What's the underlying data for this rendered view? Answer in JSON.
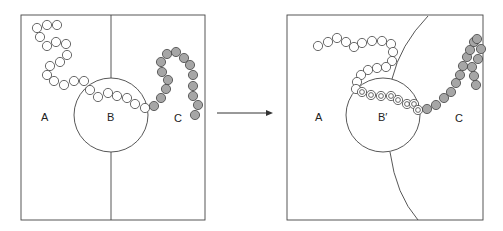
{
  "colors": {
    "stroke": "#333333",
    "bead_white": "#ffffff",
    "bead_gray": "#a6a6a6",
    "background": "#ffffff"
  },
  "left_panel": {
    "labels": {
      "region_a": "A",
      "region_b": "B",
      "region_c": "C"
    },
    "white_beads": [
      [
        37,
        28
      ],
      [
        47,
        25
      ],
      [
        57,
        25
      ],
      [
        40,
        37
      ],
      [
        47,
        46
      ],
      [
        56,
        42
      ],
      [
        66,
        44
      ],
      [
        67,
        55
      ],
      [
        60,
        62
      ],
      [
        50,
        66
      ],
      [
        47,
        75
      ],
      [
        54,
        81
      ],
      [
        64,
        85
      ],
      [
        74,
        81
      ],
      [
        84,
        81
      ],
      [
        90,
        90
      ],
      [
        98,
        97
      ],
      [
        108,
        93
      ],
      [
        117,
        96
      ],
      [
        127,
        98
      ],
      [
        135,
        104
      ],
      [
        145,
        108
      ]
    ],
    "gray_beads": [
      [
        154,
        106
      ],
      [
        161,
        98
      ],
      [
        166,
        89
      ],
      [
        168,
        80
      ],
      [
        162,
        72
      ],
      [
        161,
        62
      ],
      [
        167,
        54
      ],
      [
        176,
        52
      ],
      [
        184,
        58
      ],
      [
        190,
        65
      ],
      [
        193,
        75
      ],
      [
        193,
        86
      ],
      [
        193,
        96
      ],
      [
        198,
        105
      ],
      [
        195,
        115
      ]
    ]
  },
  "right_panel": {
    "labels": {
      "region_a": "A",
      "region_b": "B′",
      "region_c": "C"
    },
    "white_beads": [
      [
        318,
        46
      ],
      [
        328,
        42
      ],
      [
        337,
        38
      ],
      [
        346,
        42
      ],
      [
        354,
        47
      ],
      [
        362,
        43
      ],
      [
        372,
        41
      ],
      [
        382,
        41
      ],
      [
        391,
        44
      ],
      [
        393,
        52
      ],
      [
        392,
        61
      ],
      [
        386,
        67
      ],
      [
        377,
        68
      ],
      [
        368,
        70
      ],
      [
        361,
        75
      ],
      [
        357,
        82
      ],
      [
        356,
        89
      ]
    ],
    "ringed_beads": [
      [
        362,
        92
      ],
      [
        371,
        95
      ],
      [
        381,
        96
      ],
      [
        391,
        96
      ],
      [
        398,
        100
      ],
      [
        407,
        104
      ],
      [
        414,
        104
      ],
      [
        418,
        110
      ]
    ],
    "gray_beads": [
      [
        427,
        109
      ],
      [
        436,
        105
      ],
      [
        444,
        98
      ],
      [
        451,
        92
      ],
      [
        456,
        83
      ],
      [
        460,
        75
      ],
      [
        463,
        66
      ],
      [
        467,
        57
      ],
      [
        470,
        50
      ],
      [
        474,
        42
      ],
      [
        477,
        39
      ],
      [
        481,
        49
      ],
      [
        478,
        59
      ],
      [
        472,
        67
      ],
      [
        474,
        76
      ],
      [
        476,
        85
      ]
    ]
  },
  "arrow": {
    "direction": "left-to-right"
  }
}
